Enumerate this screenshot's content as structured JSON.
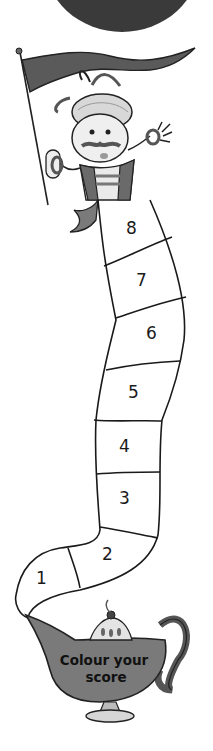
{
  "worksheet": {
    "title_text": "Colour your score",
    "lamp_label_line1": "Colour your",
    "lamp_label_line2": "score"
  },
  "score_track": {
    "segments": [
      {
        "label": "1"
      },
      {
        "label": "2"
      },
      {
        "label": "3"
      },
      {
        "label": "4"
      },
      {
        "label": "5"
      },
      {
        "label": "6"
      },
      {
        "label": "7"
      },
      {
        "label": "8"
      }
    ]
  },
  "colors": {
    "top_circle": "#3a3a3a",
    "flag": "#5a5a5a",
    "lamp_body": "#7a7a7a",
    "outline": "#1a1a1a",
    "background": "#ffffff"
  }
}
